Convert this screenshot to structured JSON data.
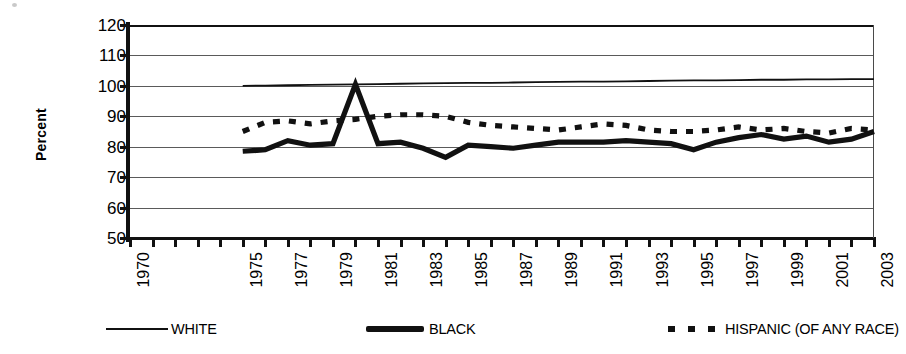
{
  "chart_data": {
    "type": "line",
    "title": "",
    "subtitle": "",
    "xlabel": "",
    "ylabel": "Percent",
    "ylim": [
      50,
      120
    ],
    "y_ticks": [
      50,
      60,
      70,
      80,
      90,
      100,
      110,
      120
    ],
    "grid": true,
    "legend_position": "bottom",
    "xlim": [
      1970,
      2003
    ],
    "x_tick_labels": [
      "1970",
      "1975",
      "1977",
      "1979",
      "1981",
      "1983",
      "1985",
      "1987",
      "1989",
      "1991",
      "1993",
      "1995",
      "1997",
      "1999",
      "2001",
      "2003"
    ],
    "x_tick_years": [
      1970,
      1975,
      1977,
      1979,
      1981,
      1983,
      1985,
      1987,
      1989,
      1991,
      1993,
      1995,
      1997,
      1999,
      2001,
      2003
    ],
    "x_minor_years": [
      1970,
      1971,
      1972,
      1973,
      1974,
      1975,
      1976,
      1977,
      1978,
      1979,
      1980,
      1981,
      1982,
      1983,
      1984,
      1985,
      1986,
      1987,
      1988,
      1989,
      1990,
      1991,
      1992,
      1993,
      1994,
      1995,
      1996,
      1997,
      1998,
      1999,
      2000,
      2001,
      2002,
      2003
    ],
    "x": [
      1975,
      1976,
      1977,
      1978,
      1979,
      1980,
      1981,
      1982,
      1983,
      1984,
      1985,
      1986,
      1987,
      1988,
      1989,
      1990,
      1991,
      1992,
      1993,
      1994,
      1995,
      1996,
      1997,
      1998,
      1999,
      2000,
      2001,
      2002,
      2003
    ],
    "series": [
      {
        "name": "WHITE",
        "style": "solid-thin",
        "color": "#111111",
        "values": [
          100.0,
          100.1,
          100.2,
          100.3,
          100.4,
          100.5,
          100.6,
          100.7,
          100.8,
          100.9,
          101.0,
          101.0,
          101.1,
          101.2,
          101.3,
          101.4,
          101.4,
          101.5,
          101.6,
          101.7,
          101.8,
          101.8,
          101.9,
          102.0,
          102.0,
          102.1,
          102.1,
          102.2,
          102.2
        ]
      },
      {
        "name": "BLACK",
        "style": "solid-thick",
        "color": "#111111",
        "values": [
          78.5,
          79.0,
          82.0,
          80.5,
          81.0,
          100.5,
          81.0,
          81.5,
          79.5,
          76.5,
          80.5,
          80.0,
          79.5,
          80.5,
          81.5,
          81.5,
          81.5,
          82.0,
          81.5,
          81.0,
          79.0,
          81.5,
          83.0,
          84.0,
          82.5,
          83.5,
          81.5,
          82.5,
          85.0
        ]
      },
      {
        "name": "HISPANIC (OF ANY RACE)",
        "style": "dashed",
        "color": "#111111",
        "values": [
          85.0,
          88.0,
          88.5,
          87.5,
          88.5,
          89.0,
          90.0,
          90.5,
          90.5,
          90.0,
          88.0,
          87.0,
          86.5,
          86.0,
          85.5,
          86.5,
          87.5,
          87.0,
          85.5,
          85.0,
          85.0,
          85.5,
          86.5,
          85.5,
          86.0,
          85.0,
          84.5,
          86.0,
          85.5
        ]
      }
    ]
  },
  "legend": {
    "entries": [
      {
        "label": "WHITE",
        "swatch": "thin-line-swatch"
      },
      {
        "label": "BLACK",
        "swatch": "thick-line-swatch"
      },
      {
        "label": "HISPANIC (OF ANY RACE)",
        "swatch": "dashed-line-swatch"
      }
    ]
  }
}
